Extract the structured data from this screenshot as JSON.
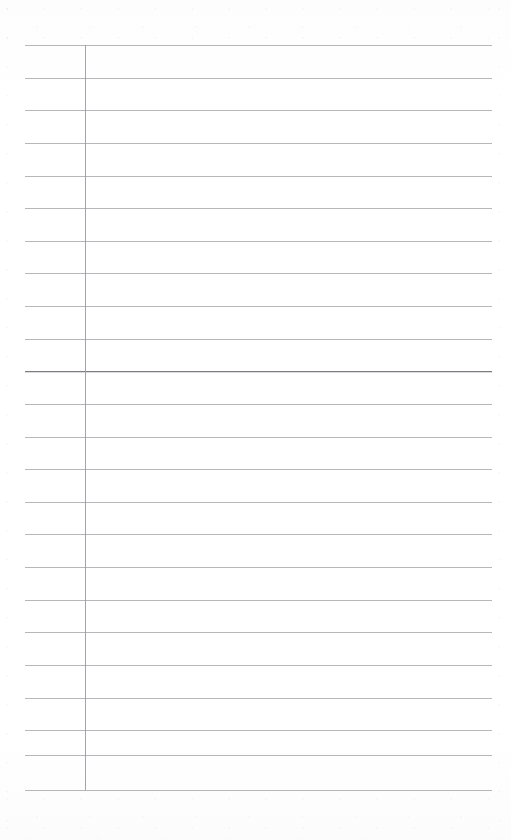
{
  "page": {
    "kind": "lined-notebook-page",
    "width": 511,
    "height": 840,
    "background_color": "#fefefe",
    "content_text": ""
  },
  "ruling": {
    "rule_color": "#a9aab0",
    "accent_rule_color": "#7b7d84",
    "margin_rule_color": "#9a9ba1",
    "line_count": 24,
    "line_spacing_px": 32.4,
    "first_line_y": 45,
    "last_line_y": 790,
    "left_x": 25,
    "right_x": 492,
    "accent_line_index": 10,
    "horizontal_lines_y": [
      45,
      78,
      110,
      143,
      176,
      208,
      241,
      273,
      306,
      339,
      371,
      404,
      437,
      469,
      502,
      534,
      567,
      600,
      632,
      665,
      698,
      730,
      755,
      790
    ]
  },
  "margin_rule": {
    "x": 85,
    "top_y": 45,
    "bottom_y": 790,
    "label": "left-margin-rule"
  },
  "columns": {
    "narrow_label": "",
    "wide_label": ""
  }
}
